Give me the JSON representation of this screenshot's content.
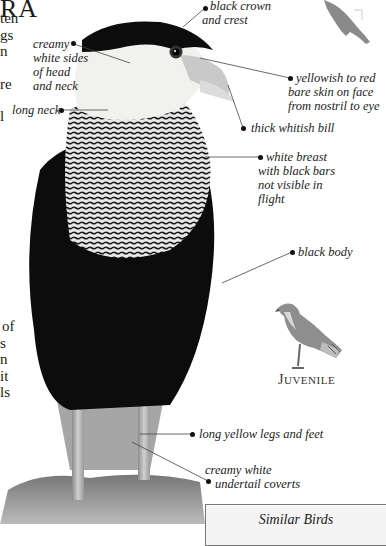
{
  "page": {
    "title_fragment": "RA",
    "body_text_fragments_top": [
      "ten",
      "gs",
      "n",
      "",
      "re",
      "",
      "l"
    ],
    "body_text_fragments_lower": [
      "of",
      "s",
      "n",
      "it",
      "ls"
    ]
  },
  "labels": {
    "black_crown": [
      "black crown",
      "and crest"
    ],
    "creamy_sides": [
      "creamy",
      "white sides",
      "of head",
      "and neck"
    ],
    "long_neck": "long neck",
    "bare_skin": [
      "yellowish to red",
      "bare skin on face",
      "from nostril to eye"
    ],
    "bill": "thick whitish bill",
    "breast": [
      "white breast",
      "with black bars",
      "not visible in",
      "flight"
    ],
    "body": "black body",
    "legs": "long yellow legs and feet",
    "undertail": [
      "creamy white",
      "undertail coverts"
    ]
  },
  "juvenile": {
    "first_letter": "J",
    "rest": "UVENILE"
  },
  "similar_birds": {
    "title": "Similar Birds"
  },
  "icons": {
    "silhouette": "bird-silhouette-icon"
  },
  "colors": {
    "silhouette": "#8a8a8a",
    "leader_line": "#444444",
    "box_border": "#777777"
  }
}
